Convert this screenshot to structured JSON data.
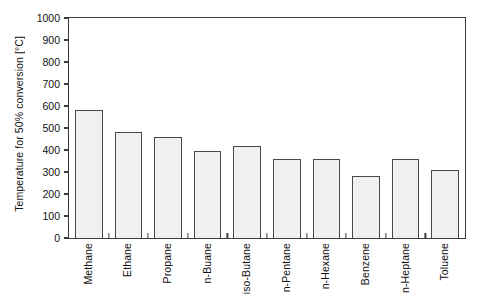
{
  "chart_data": {
    "type": "bar",
    "title": "",
    "xlabel": "",
    "ylabel": "Temperature for 50% conversion [°C]",
    "ylim": [
      0,
      1000
    ],
    "yticks": [
      0,
      100,
      200,
      300,
      400,
      500,
      600,
      700,
      800,
      900,
      1000
    ],
    "ytick_labels": [
      "0",
      "100",
      "200",
      "300",
      "400",
      "500",
      "600",
      "700",
      "800",
      "900",
      "1000"
    ],
    "grid": false,
    "legend": null,
    "bar_fill_color": "#f0f0f0",
    "bar_edge_color": "#4a4a4a",
    "axis_color": "#3c3c3c",
    "categories": [
      "Methane",
      "Ethane",
      "Propane",
      "n-Buane",
      "iso-Butane",
      "n-Pentane",
      "n-Hexane",
      "Benzene",
      "n-Heptane",
      "Toluene"
    ],
    "values": [
      580,
      480,
      460,
      395,
      420,
      360,
      358,
      282,
      360,
      308
    ]
  }
}
